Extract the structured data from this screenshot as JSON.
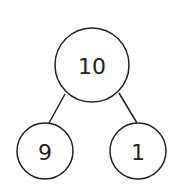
{
  "diagram": {
    "type": "number-bond",
    "colors": {
      "stroke": "#222222",
      "background": "#ffffff",
      "text": "#222222"
    },
    "whole": {
      "label": "10",
      "cx": 92,
      "cy": 65,
      "r": 37
    },
    "parts": [
      {
        "label": "9",
        "cx": 45,
        "cy": 151,
        "r": 28
      },
      {
        "label": "1",
        "cx": 138,
        "cy": 151,
        "r": 28
      }
    ],
    "edges": [
      {
        "from": "10",
        "to": "9"
      },
      {
        "from": "10",
        "to": "1"
      }
    ]
  }
}
